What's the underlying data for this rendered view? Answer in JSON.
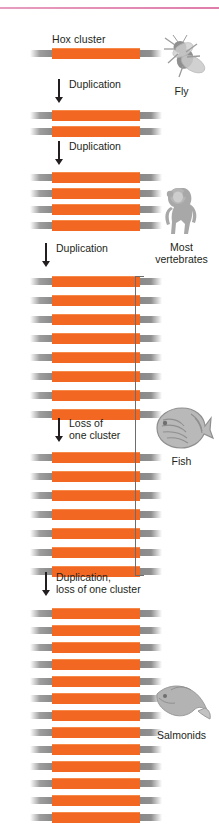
{
  "figure": {
    "title_label": "Hox cluster",
    "accent_color": "#f26722",
    "cap_color": "#8f8f8f",
    "rule_color": "#d9669b",
    "text_color": "#231f20"
  },
  "groups": [
    {
      "id": "fly",
      "count": 1,
      "top": 48,
      "row_pitch": 0
    },
    {
      "id": "two-cluster",
      "count": 2,
      "top": 110,
      "row_pitch": 16
    },
    {
      "id": "most-vertebrates",
      "count": 4,
      "top": 172,
      "row_pitch": 16
    },
    {
      "id": "eight-cluster",
      "count": 8,
      "top": 276,
      "row_pitch": 19
    },
    {
      "id": "fish",
      "count": 7,
      "top": 452,
      "row_pitch": 19
    },
    {
      "id": "salmonids",
      "count": 13,
      "top": 608,
      "row_pitch": 17
    }
  ],
  "steps": [
    {
      "id": "step-1",
      "label": "Duplication",
      "top": 79,
      "arrow_left": 55,
      "height": 24
    },
    {
      "id": "step-2",
      "label": "Duplication",
      "top": 141,
      "arrow_left": 55,
      "height": 24
    },
    {
      "id": "step-3",
      "label": "Duplication",
      "top": 243,
      "arrow_left": 42,
      "height": 24
    },
    {
      "id": "step-4",
      "label": "Loss of\none cluster",
      "top": 418,
      "arrow_left": 55,
      "height": 24
    },
    {
      "id": "step-5",
      "label": "Duplication,\nloss of one cluster",
      "top": 572,
      "arrow_left": 42,
      "height": 24
    }
  ],
  "organisms": [
    {
      "id": "fly",
      "name": "Fly",
      "left": 142,
      "top": 30
    },
    {
      "id": "most-vertebrates",
      "name": "Most\nvertebrates",
      "left": 142,
      "top": 182
    },
    {
      "id": "fish",
      "name": "Fish",
      "left": 142,
      "top": 404
    },
    {
      "id": "salmonids",
      "name": "Salmonids",
      "left": 142,
      "top": 680
    }
  ],
  "bracket": {
    "top": 276,
    "height": 300,
    "left": 135,
    "width": 9
  },
  "hox_label": {
    "left": 52,
    "top": 33
  },
  "chart_data": {
    "type": "diagram",
    "stages": [
      {
        "stage": 1,
        "organism": "Fly",
        "hox_clusters": 1,
        "event_to_next": "Duplication"
      },
      {
        "stage": 2,
        "organism": "",
        "hox_clusters": 2,
        "event_to_next": "Duplication"
      },
      {
        "stage": 3,
        "organism": "Most vertebrates",
        "hox_clusters": 4,
        "event_to_next": "Duplication"
      },
      {
        "stage": 4,
        "organism": "",
        "hox_clusters": 8,
        "event_to_next": "Loss of one cluster"
      },
      {
        "stage": 5,
        "organism": "Fish",
        "hox_clusters": 7,
        "event_to_next": "Duplication, loss of one cluster"
      },
      {
        "stage": 6,
        "organism": "Salmonids",
        "hox_clusters": 13,
        "event_to_next": ""
      }
    ],
    "bracket_spans_stages": [
      4,
      5
    ],
    "bracket_label": "Fish"
  }
}
